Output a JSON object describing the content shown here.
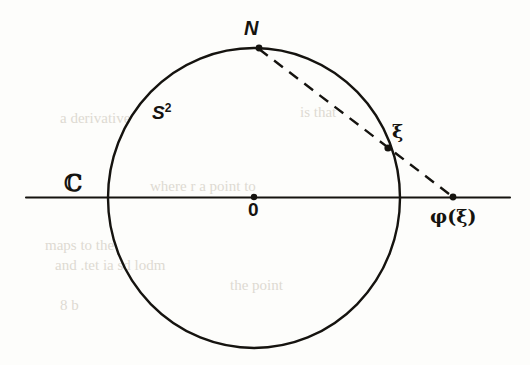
{
  "figure": {
    "background_color": "#fdfdfb",
    "ink_color": "#15130f"
  },
  "labels": {
    "north_pole": "N",
    "sphere": "S",
    "sphere_exponent": "2",
    "complex_plane": "ℂ",
    "origin": "0",
    "point_on_sphere": "ξ",
    "projected_point": "φ(ξ)"
  },
  "geometry": {
    "plane_line": {
      "x1": 26,
      "y1": 197,
      "x2": 510,
      "y2": 197
    },
    "circle": {
      "cx": 254,
      "cy": 198,
      "rx": 146,
      "ry": 150
    },
    "points": [
      {
        "name": "north-pole",
        "label": "N",
        "x": 259,
        "y": 48
      },
      {
        "name": "origin",
        "label": "0",
        "x": 254,
        "y": 197
      },
      {
        "name": "xi",
        "label": "ξ",
        "x": 388,
        "y": 148
      },
      {
        "name": "phi-xi",
        "label": "φ(ξ)",
        "x": 453,
        "y": 197
      }
    ],
    "projection_ray": {
      "x1": 259,
      "y1": 48,
      "x2": 453,
      "y2": 197,
      "style": "dashed"
    }
  },
  "ghost_text": [
    {
      "text": "a derivative",
      "x": 60,
      "y": 118
    },
    {
      "text": "is that",
      "x": 300,
      "y": 112
    },
    {
      "text": "where r a point to",
      "x": 150,
      "y": 186
    },
    {
      "text": "maps to the",
      "x": 45,
      "y": 245
    },
    {
      "text": "and  .tet  ia  sd  lodm",
      "x": 55,
      "y": 265
    },
    {
      "text": "the point",
      "x": 230,
      "y": 285
    },
    {
      "text": "8 b",
      "x": 60,
      "y": 305
    }
  ]
}
